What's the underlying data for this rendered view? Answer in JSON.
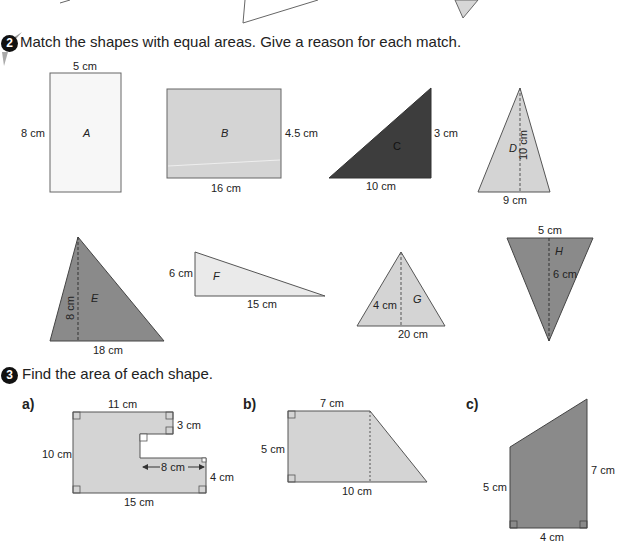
{
  "q2": {
    "number": "2",
    "instruction": "Match the shapes with equal areas. Give a reason for each match.",
    "shapes": {
      "A": {
        "label": "A",
        "type": "rectangle",
        "width": "5 cm",
        "height": "8 cm"
      },
      "B": {
        "label": "B",
        "type": "rectangle",
        "width": "16 cm",
        "height": "4.5 cm"
      },
      "C": {
        "label": "C",
        "type": "right-triangle",
        "base": "10 cm",
        "height": "3 cm"
      },
      "D": {
        "label": "D",
        "type": "triangle",
        "base": "9 cm",
        "height": "10 cm"
      },
      "E": {
        "label": "E",
        "type": "triangle",
        "base": "18 cm",
        "height": "8 cm"
      },
      "F": {
        "label": "F",
        "type": "right-triangle",
        "base": "15 cm",
        "height": "6 cm"
      },
      "G": {
        "label": "G",
        "type": "triangle",
        "base": "20 cm",
        "height": "4 cm"
      },
      "H": {
        "label": "H",
        "type": "inverted-triangle",
        "base": "5 cm",
        "height": "6 cm"
      }
    }
  },
  "q3": {
    "number": "3",
    "instruction": "Find the area of each shape.",
    "a": {
      "label": "a)",
      "top": "11 cm",
      "left": "10 cm",
      "notch_top": "3 cm",
      "notch_depth": "8 cm",
      "right_bottom": "4 cm",
      "bottom": "15 cm"
    },
    "b": {
      "label": "b)",
      "top": "7 cm",
      "left": "5 cm",
      "bottom": "10 cm"
    },
    "c": {
      "label": "c)",
      "left": "5 cm",
      "right": "7 cm",
      "bottom": "4 cm"
    }
  },
  "colors": {
    "light": "#f5f5f5",
    "mid": "#cfcfcf",
    "dark": "#444444",
    "darkgray": "#8a8a8a",
    "stroke": "#555555"
  }
}
